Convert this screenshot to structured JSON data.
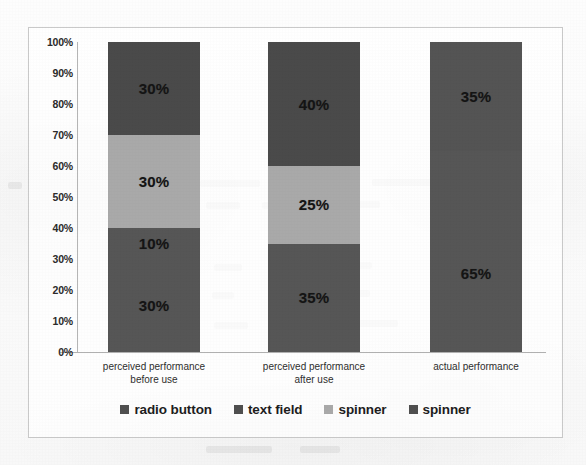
{
  "chart_data": {
    "type": "bar",
    "subtype": "stacked-bar-100-percent",
    "title": "",
    "xlabel": "",
    "ylabel": "",
    "ylim": [
      0,
      100
    ],
    "grid": false,
    "legend_position": "bottom",
    "categories": [
      "perceived performance before use",
      "perceived performance after use",
      "actual performance"
    ],
    "category_lines": [
      [
        "perceived performance",
        "before use"
      ],
      [
        "perceived performance",
        "after use"
      ],
      [
        "actual performance",
        ""
      ]
    ],
    "y_tick_labels": [
      "100%",
      "90%",
      "80%",
      "70%",
      "60%",
      "50%",
      "40%",
      "30%",
      "20%",
      "10%",
      "0%"
    ],
    "y_ticks": [
      100,
      90,
      80,
      70,
      60,
      50,
      40,
      30,
      20,
      10,
      0
    ],
    "series": [
      {
        "name": "radio button",
        "color": "#565656",
        "values": [
          30,
          35,
          65
        ]
      },
      {
        "name": "text field",
        "color": "#565656",
        "values": [
          10,
          0,
          0
        ]
      },
      {
        "name": "spinner",
        "color": "#a9a9a9",
        "values": [
          30,
          25,
          0
        ]
      },
      {
        "name": "spinner",
        "color": "#4a4a4a",
        "values": [
          30,
          40,
          35
        ]
      }
    ],
    "stacks": [
      {
        "category": "perceived performance before use",
        "segments": [
          {
            "series": "radio button",
            "value": 30,
            "label": "30%",
            "color": "#565656"
          },
          {
            "series": "text field",
            "value": 10,
            "label": "10%",
            "color": "#565656"
          },
          {
            "series": "spinner",
            "value": 30,
            "label": "30%",
            "color": "#a9a9a9"
          },
          {
            "series": "spinner",
            "value": 30,
            "label": "30%",
            "color": "#4a4a4a"
          }
        ]
      },
      {
        "category": "perceived performance after use",
        "segments": [
          {
            "series": "radio button",
            "value": 35,
            "label": "35%",
            "color": "#565656"
          },
          {
            "series": "spinner",
            "value": 25,
            "label": "25%",
            "color": "#a9a9a9"
          },
          {
            "series": "spinner",
            "value": 40,
            "label": "40%",
            "color": "#4a4a4a"
          }
        ]
      },
      {
        "category": "actual performance",
        "segments": [
          {
            "series": "radio button",
            "value": 65,
            "label": "65%",
            "color": "#565656"
          },
          {
            "series": "spinner",
            "value": 35,
            "label": "35%",
            "color": "#545454"
          }
        ]
      }
    ],
    "legend": [
      {
        "label": "radio button",
        "color": "#4f4f4f"
      },
      {
        "label": "text field",
        "color": "#4f4f4f"
      },
      {
        "label": "spinner",
        "color": "#a9a9a9"
      },
      {
        "label": "spinner",
        "color": "#4f4f4f"
      }
    ]
  },
  "colors": {
    "dark_segment": "#4a4a4a",
    "mid_segment": "#565656",
    "light_segment": "#a9a9a9",
    "frame_border": "#c9c9c9",
    "axis_line": "#b5b5b5",
    "page_background": "#fdfdfd",
    "text": "#1d1d1d"
  }
}
